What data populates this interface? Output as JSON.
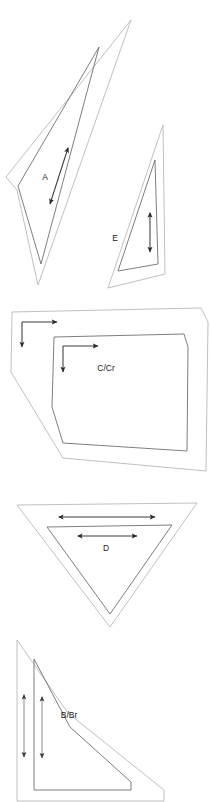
{
  "figure": {
    "background_color": "#ffffff",
    "outer_outline_color": "#b9b9b9",
    "inner_outline_color": "#6f6f6f",
    "arrow_color": "#3a3a3a",
    "arrow_color_light": "#8a8a8a",
    "label_color": "#1b1b1b",
    "width": 211,
    "height": 802
  },
  "panels": [
    {
      "id": "panel-a-e",
      "index": 1,
      "shapes": [
        {
          "id": "shape-a",
          "label": "A",
          "label_x": 45,
          "label_y": 178,
          "outer_points": "131,20 6,177 17,190 38,285",
          "inner_points": "99,47 18,186 41,264",
          "dimension": {
            "type": "double-arrow",
            "orientation": "diagonal",
            "x1": 68,
            "y1": 148,
            "x2": 50,
            "y2": 204
          }
        },
        {
          "id": "shape-e",
          "label": "E",
          "label_x": 115,
          "label_y": 239,
          "outer_points": "163,125 108,288 165,274",
          "inner_points": "155,160 118,271 158,264",
          "dimension": {
            "type": "double-arrow",
            "orientation": "vertical",
            "x1": 150,
            "y1": 213,
            "x2": 150,
            "y2": 252
          }
        }
      ]
    },
    {
      "id": "panel-c-cr",
      "index": 2,
      "shapes": [
        {
          "id": "shape-c-cr",
          "label": "C/Cr",
          "label_x": 106,
          "label_y": 369,
          "outer_points": "12,312 201,308 208,322 206,471 63,458 11,372",
          "inner_points": "54,337 184,334 188,347 187,451 63,443 52,407",
          "dimension": {
            "type": "corner-arrows",
            "outer_corner": {
              "vx": 22,
              "vy": 322,
              "hx2": 57,
              "dy2": 347
            },
            "inner_corner": {
              "vx": 63,
              "vy": 346,
              "hx2": 98,
              "dy2": 372
            }
          }
        }
      ]
    },
    {
      "id": "panel-d",
      "index": 3,
      "shapes": [
        {
          "id": "shape-d",
          "label": "D",
          "label_x": 106,
          "label_y": 548,
          "outer_points": "17,505 197,503 110,627",
          "inner_points": "47,527 172,525 110,614",
          "dimensions": [
            {
              "type": "double-arrow",
              "orientation": "horizontal",
              "x1": 59,
              "y1": 517,
              "x2": 155,
              "y2": 517
            },
            {
              "type": "double-arrow",
              "orientation": "horizontal",
              "x1": 78,
              "y1": 536,
              "x2": 137,
              "y2": 536
            }
          ]
        }
      ]
    },
    {
      "id": "panel-b-br",
      "index": 4,
      "shapes": [
        {
          "id": "shape-b-br",
          "label": "B/Br",
          "label_x": 69,
          "label_y": 715,
          "outer_points": "17,640 17,801 164,801 164,790 68,713",
          "inner_points": "34,659 34,790 131,790 131,782 70,727",
          "dimensions": [
            {
              "type": "double-arrow",
              "orientation": "vertical",
              "x1": 24,
              "y1": 695,
              "x2": 24,
              "y2": 757
            },
            {
              "type": "double-arrow",
              "orientation": "vertical",
              "x1": 42,
              "y1": 697,
              "x2": 42,
              "y2": 758
            }
          ]
        }
      ]
    }
  ],
  "labels": {
    "a": "A",
    "e": "E",
    "c_cr": "C/Cr",
    "d": "D",
    "b_br": "B/Br"
  }
}
